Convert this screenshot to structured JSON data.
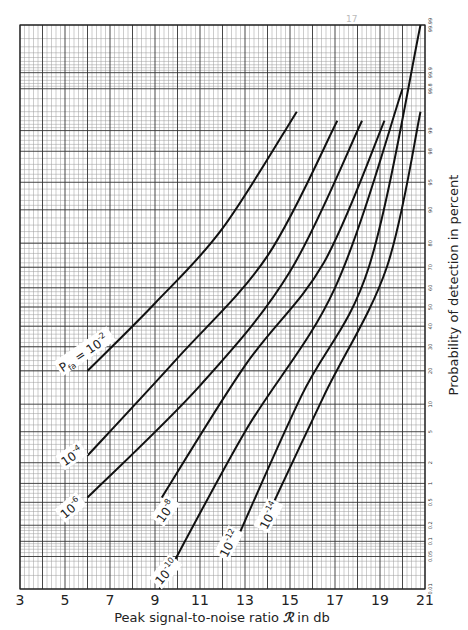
{
  "page_mark": "17",
  "chart_data": {
    "type": "line",
    "title": "",
    "xlabel": "Peak signal-to-noise ratio ℛ in db",
    "ylabel": "Probability of detection in percent",
    "xlim": [
      3,
      21
    ],
    "ylim": [
      0.01,
      99.99
    ],
    "y_scale": "normal-probability",
    "grid": true,
    "legend_position": "inline curve labels",
    "x_ticks": [
      "3",
      "5",
      "7",
      "9",
      "11",
      "13",
      "15",
      "17",
      "19",
      "21"
    ],
    "y_ticks": [
      "0.01",
      "0.05",
      "0.1",
      "0.2",
      "0.5",
      "1",
      "2",
      "5",
      "10",
      "20",
      "30",
      "40",
      "50",
      "60",
      "70",
      "80",
      "90",
      "95",
      "98",
      "99",
      "99.8",
      "99.9",
      "99.99"
    ],
    "parameter": "Pfa (probability of false alarm)",
    "series": [
      {
        "name": "Pfa = 10^-2",
        "label_main": "Pfa = 10",
        "label_exp": "-2",
        "x": [
          6.0,
          9.0,
          12.0,
          15.3
        ],
        "y": [
          20,
          52,
          85,
          99.5
        ]
      },
      {
        "name": "10^-4",
        "label_main": "10",
        "label_exp": "-4",
        "x": [
          6.0,
          10.0,
          14.0,
          17.1
        ],
        "y": [
          2.5,
          25,
          75,
          99.3
        ]
      },
      {
        "name": "10^-6",
        "label_main": "10",
        "label_exp": "-6",
        "x": [
          6.0,
          11.0,
          15.0,
          18.2
        ],
        "y": [
          0.6,
          15,
          68,
          99.3
        ]
      },
      {
        "name": "10^-8",
        "label_main": "10",
        "label_exp": "-8",
        "x": [
          9.3,
          13.0,
          16.5,
          19.2
        ],
        "y": [
          0.6,
          22,
          72,
          99.3
        ]
      },
      {
        "name": "10^-10",
        "label_main": "10",
        "label_exp": "-10",
        "x": [
          9.2,
          13.0,
          17.0,
          20.0
        ],
        "y": [
          0.01,
          5,
          60,
          99.8
        ]
      },
      {
        "name": "10^-12",
        "label_main": "10",
        "label_exp": "-12",
        "x": [
          12.3,
          15.5,
          18.5,
          20.8
        ],
        "y": [
          0.05,
          12,
          70,
          99.99
        ]
      },
      {
        "name": "10^-14",
        "label_main": "10",
        "label_exp": "-14",
        "x": [
          13.8,
          16.5,
          19.3,
          20.8
        ],
        "y": [
          0.2,
          12,
          70,
          99.5
        ]
      }
    ]
  },
  "labels": {
    "x_ticks": [
      "3",
      "5",
      "7",
      "9",
      "11",
      "13",
      "15",
      "17",
      "19",
      "21"
    ],
    "y_ticks": [
      "0.01",
      "0.05",
      "0.1",
      "0.2",
      "0.5",
      "1",
      "2",
      "5",
      "10",
      "20",
      "30",
      "40",
      "50",
      "60",
      "70",
      "80",
      "90",
      "95",
      "98",
      "99",
      "99.8",
      "99.9",
      "99.99"
    ],
    "xlabel_pre": "Peak signal-to-noise ratio ",
    "xlabel_sym": "ℛ",
    "xlabel_post": " in db",
    "ylabel": "Probability of detection in percent",
    "curves": [
      {
        "main": "P",
        "sub": "fa",
        "eq": " = 10",
        "exp": "-2"
      },
      {
        "main": "10",
        "exp": "-4"
      },
      {
        "main": "10",
        "exp": "-6"
      },
      {
        "main": "10",
        "exp": "-8"
      },
      {
        "main": "10",
        "exp": "-10"
      },
      {
        "main": "10",
        "exp": "-12"
      },
      {
        "main": "10",
        "exp": "-14"
      }
    ]
  }
}
